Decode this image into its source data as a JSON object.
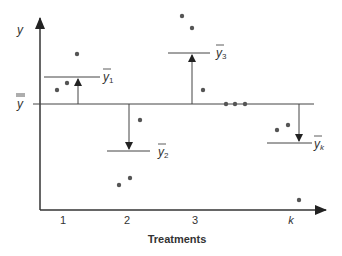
{
  "axes": {
    "y_label": "y",
    "x_label": "Treatments",
    "x_ticks": [
      "1",
      "2",
      "3",
      "k"
    ],
    "grand_mean_label": "y",
    "color": "#333333"
  },
  "means": [
    {
      "label": "y",
      "subscript": "1"
    },
    {
      "label": "y",
      "subscript": "2"
    },
    {
      "label": "y",
      "subscript": "3"
    },
    {
      "label": "y",
      "subscript": "k"
    }
  ],
  "colors": {
    "dot": "#555555",
    "line": "#333333",
    "background": "#ffffff"
  }
}
